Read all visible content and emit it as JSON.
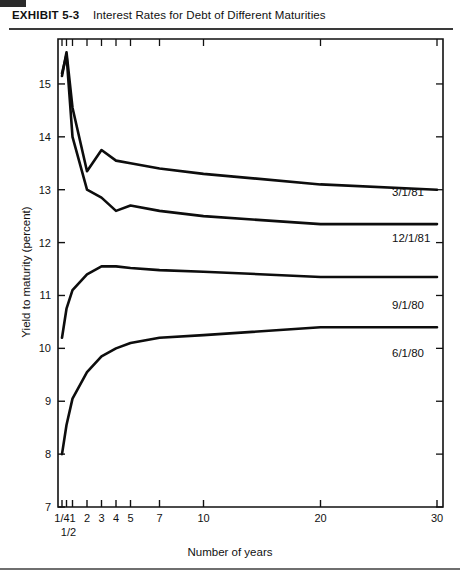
{
  "header": {
    "exhibit_label": "EXHIBIT 5-3",
    "exhibit_title": "Interest Rates for Debt of Different Maturities"
  },
  "chart_data": {
    "type": "line",
    "title": "Interest Rates for Debt of Different Maturities",
    "xlabel": "Number of years",
    "ylabel": "Yield to maturity (percent)",
    "x_tick_labels": [
      "1/4",
      "1/2",
      "1",
      "2",
      "3",
      "4",
      "5",
      "7",
      "10",
      "20",
      "30"
    ],
    "x_values": [
      0.25,
      0.5,
      1,
      2,
      3,
      4,
      5,
      7,
      10,
      20,
      30
    ],
    "y_tick_labels": [
      "7",
      "8",
      "9",
      "10",
      "11",
      "12",
      "13",
      "14",
      "15"
    ],
    "ylim": [
      7,
      15.85
    ],
    "xlim_scale": "maturity-ordinal",
    "grid": false,
    "legend_position": "right-inline",
    "series": [
      {
        "name": "3/1/81",
        "values": [
          15.15,
          15.6,
          14.55,
          13.35,
          13.75,
          13.55,
          13.5,
          13.4,
          13.3,
          13.1,
          13.0
        ]
      },
      {
        "name": "12/1/81",
        "values": [
          15.2,
          15.55,
          14.0,
          13.0,
          12.85,
          12.6,
          12.7,
          12.6,
          12.5,
          12.35,
          12.35
        ]
      },
      {
        "name": "9/1/80",
        "values": [
          10.2,
          10.75,
          11.1,
          11.4,
          11.55,
          11.55,
          11.52,
          11.48,
          11.45,
          11.35,
          11.35
        ]
      },
      {
        "name": "6/1/80",
        "values": [
          8.0,
          8.55,
          9.05,
          9.55,
          9.85,
          10.0,
          10.1,
          10.2,
          10.25,
          10.4,
          10.4
        ]
      }
    ]
  }
}
